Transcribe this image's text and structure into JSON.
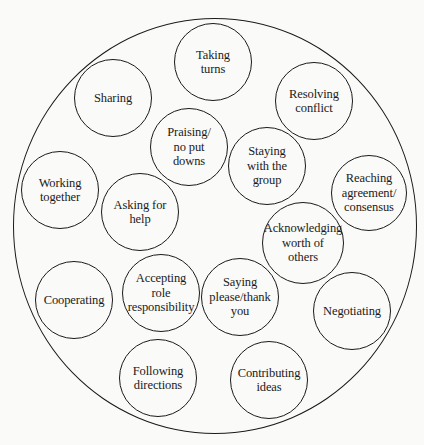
{
  "diagram": {
    "type": "bubble-cluster",
    "outer_circle": {
      "cx": 215,
      "cy": 226,
      "rx": 202,
      "ry": 208
    },
    "bubbles": [
      {
        "id": "taking-turns",
        "label": "Taking\nturns",
        "cx": 213,
        "cy": 62,
        "r": 39
      },
      {
        "id": "sharing",
        "label": "Sharing",
        "cx": 113,
        "cy": 98,
        "r": 39
      },
      {
        "id": "resolving-conflict",
        "label": "Resolving\nconflict",
        "cx": 314,
        "cy": 101,
        "r": 39
      },
      {
        "id": "praising",
        "label": "Praising/\nno put\ndowns",
        "cx": 189,
        "cy": 147,
        "r": 39
      },
      {
        "id": "staying-with-group",
        "label": "Staying\nwith the\ngroup",
        "cx": 267,
        "cy": 166,
        "r": 39
      },
      {
        "id": "working-together",
        "label": "Working\ntogether",
        "cx": 60,
        "cy": 190,
        "r": 39
      },
      {
        "id": "reaching-agreement",
        "label": "Reaching\nagreement/\nconsensus",
        "cx": 369,
        "cy": 193,
        "r": 38
      },
      {
        "id": "asking-for-help",
        "label": "Asking for\nhelp",
        "cx": 140,
        "cy": 212,
        "r": 39
      },
      {
        "id": "acknowledging-worth",
        "label": "Acknowledging\nworth of\nothers",
        "cx": 303,
        "cy": 243,
        "r": 41
      },
      {
        "id": "cooperating",
        "label": "Cooperating",
        "cx": 74,
        "cy": 300,
        "r": 39
      },
      {
        "id": "accepting-role",
        "label": "Accepting\nrole\nresponsibility",
        "cx": 161,
        "cy": 293,
        "r": 39
      },
      {
        "id": "saying-please",
        "label": "Saying\nplease/thank\nyou",
        "cx": 240,
        "cy": 297,
        "r": 39
      },
      {
        "id": "negotiating",
        "label": "Negotiating",
        "cx": 352,
        "cy": 311,
        "r": 39
      },
      {
        "id": "following-directions",
        "label": "Following\ndirections",
        "cx": 158,
        "cy": 378,
        "r": 39
      },
      {
        "id": "contributing-ideas",
        "label": "Contributing\nideas",
        "cx": 269,
        "cy": 380,
        "r": 39
      }
    ]
  }
}
